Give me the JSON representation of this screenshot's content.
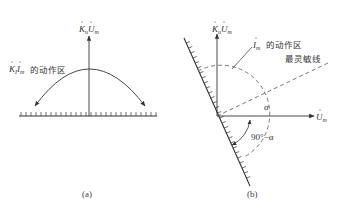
{
  "figure": {
    "top_strip_text": "",
    "panel_a": {
      "caption": "(a)",
      "vertical_axis_label": "K̇uU̇m",
      "vertical_axis_label_parts": {
        "k": "K",
        "k_sub": "u",
        "u": "U",
        "u_sub": "m"
      },
      "zone_label_math": "K̇iİm",
      "zone_label_parts": {
        "k": "K",
        "k_sub": "I",
        "i": "I",
        "i_sub": "m"
      },
      "zone_label_text": "的动作区"
    },
    "panel_b": {
      "caption": "(b)",
      "vertical_axis_label_parts": {
        "k": "K",
        "k_sub": "u",
        "u": "U",
        "u_sub": "m"
      },
      "horizontal_axis_label_parts": {
        "u": "U",
        "u_sub": "m"
      },
      "zone_label_parts": {
        "i": "I",
        "i_sub": "m"
      },
      "zone_label_text": "的动作区",
      "sensitivity_line_label": "最灵敏线",
      "angle_alpha": "α",
      "angle_complement": "90°−α"
    },
    "colors": {
      "line": "#333333",
      "dashed": "#555555",
      "background": "#ffffff"
    }
  }
}
